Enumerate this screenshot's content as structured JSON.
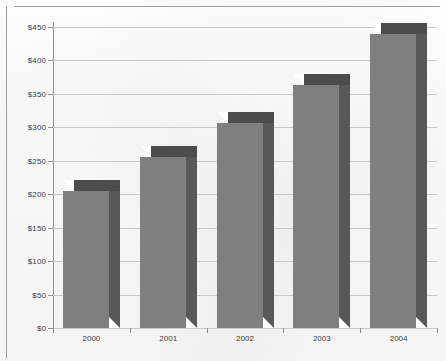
{
  "chart_data": {
    "type": "bar",
    "title": "",
    "xlabel": "",
    "ylabel": "",
    "categories": [
      "2000",
      "2001",
      "2002",
      "2003",
      "2004"
    ],
    "values": [
      205,
      255,
      307,
      363,
      440
    ],
    "value_prefix": "$",
    "ylim": [
      0,
      450
    ],
    "ytick_step": 50,
    "ytick_labels": [
      "$450",
      "$400",
      "$350",
      "$300",
      "$250",
      "$200",
      "$150",
      "$100",
      "$50",
      "$0"
    ],
    "ytick_values": [
      450,
      400,
      350,
      300,
      250,
      200,
      150,
      100,
      50,
      0
    ],
    "grid": true,
    "legend": false,
    "legend_position": "none",
    "style": "3d-blocks",
    "series": [
      {
        "name": "",
        "values": [
          205,
          255,
          307,
          363,
          440
        ]
      }
    ]
  },
  "colors": {
    "bar_front": "#7f7f7f",
    "bar_side": "#585858",
    "bar_top": "#4c4c4c",
    "gridline": "#c9c9c9",
    "axis": "#8e8e8e",
    "text": "#3d3d3d",
    "background": "#fcfcfb"
  }
}
